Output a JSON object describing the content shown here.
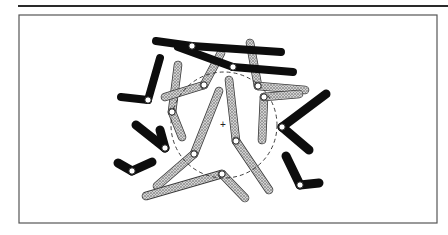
{
  "figure": {
    "type": "chromosome-spread-diagram",
    "colors": {
      "black_chromosome": "#0d0d0d",
      "stippled_chromosome_fill": "#bdbdbd",
      "stippled_chromosome_outline": "#3a3a3a",
      "centromere": "#ffffff",
      "frame": "#555555",
      "background": "#ffffff"
    },
    "top_rule": {
      "x1": 18,
      "y1": 6,
      "x2": 448,
      "y2": 6
    },
    "frame": {
      "x": 19,
      "y": 15,
      "width": 418,
      "height": 208
    },
    "dashed_circle": {
      "cx": 224,
      "cy": 125,
      "r": 53
    },
    "center_marker": {
      "x": 223,
      "y": 125,
      "label": "+"
    },
    "black_chromosomes": [
      {
        "id": "b1",
        "centromere": [
          192,
          46
        ],
        "arms": [
          [
            156,
            41
          ],
          [
            281,
            52
          ]
        ],
        "width": 8
      },
      {
        "id": "b2",
        "centromere": [
          233,
          67
        ],
        "arms": [
          [
            178,
            47
          ],
          [
            293,
            72
          ]
        ],
        "width": 8
      },
      {
        "id": "b3",
        "centromere": [
          148,
          100
        ],
        "arms": [
          [
            121,
            97
          ],
          [
            160,
            58
          ]
        ],
        "width": 8
      },
      {
        "id": "b4",
        "centromere": [
          165,
          148
        ],
        "arms": [
          [
            136,
            125
          ],
          [
            160,
            130
          ]
        ],
        "width": 9
      },
      {
        "id": "b5",
        "centromere": [
          132,
          171
        ],
        "arms": [
          [
            118,
            163
          ],
          [
            152,
            162
          ]
        ],
        "width": 9
      },
      {
        "id": "b6",
        "centromere": [
          282,
          127
        ],
        "arms": [
          [
            326,
            94
          ],
          [
            309,
            150
          ]
        ],
        "width": 9
      },
      {
        "id": "b7",
        "centromere": [
          300,
          185
        ],
        "arms": [
          [
            286,
            156
          ],
          [
            319,
            183
          ]
        ],
        "width": 9
      }
    ],
    "stippled_chromosomes": [
      {
        "id": "s1",
        "centromere": [
          172,
          112
        ],
        "arms": [
          [
            178,
            65
          ],
          [
            182,
            137
          ]
        ],
        "width": 7
      },
      {
        "id": "s2",
        "centromere": [
          204,
          85
        ],
        "arms": [
          [
            165,
            97
          ],
          [
            221,
            53
          ]
        ],
        "width": 7
      },
      {
        "id": "s3",
        "centromere": [
          258,
          86
        ],
        "arms": [
          [
            250,
            43
          ],
          [
            305,
            90
          ]
        ],
        "width": 7
      },
      {
        "id": "s4",
        "centromere": [
          264,
          97
        ],
        "arms": [
          [
            262,
            140
          ],
          [
            299,
            94
          ]
        ],
        "width": 7
      },
      {
        "id": "s5",
        "centromere": [
          194,
          154
        ],
        "arms": [
          [
            219,
            91
          ],
          [
            157,
            186
          ]
        ],
        "width": 7
      },
      {
        "id": "s6",
        "centromere": [
          236,
          141
        ],
        "arms": [
          [
            229,
            80
          ],
          [
            269,
            190
          ]
        ],
        "width": 7
      },
      {
        "id": "s7",
        "centromere": [
          222,
          174
        ],
        "arms": [
          [
            146,
            196
          ],
          [
            245,
            198
          ]
        ],
        "width": 7
      }
    ]
  }
}
